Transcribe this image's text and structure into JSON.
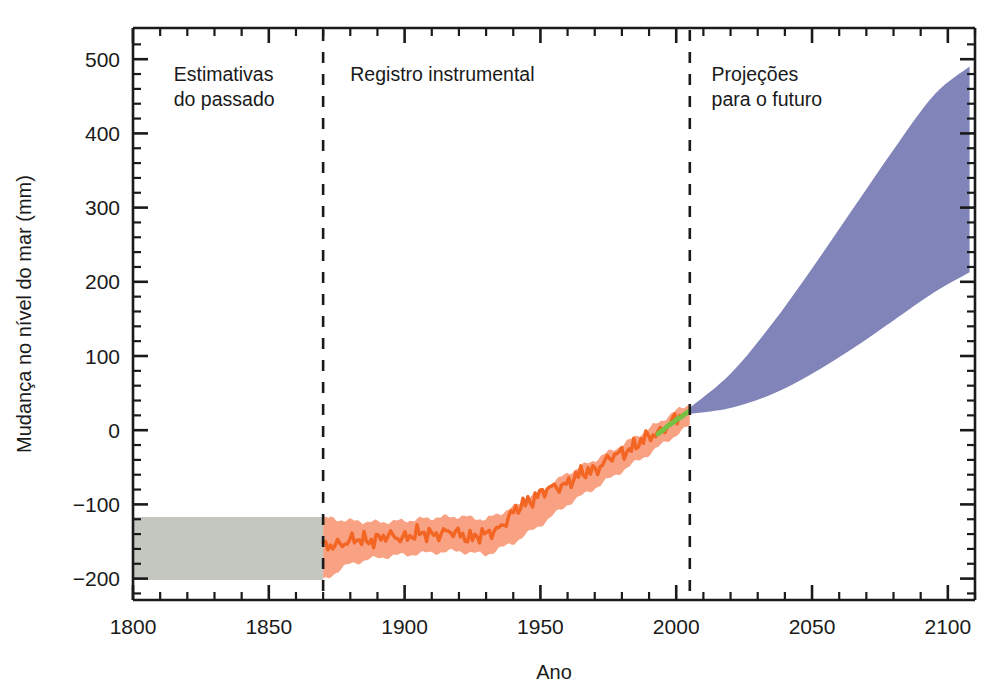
{
  "chart_data": {
    "type": "area",
    "title": "",
    "subtitle": "",
    "xlabel": "Ano",
    "ylabel": "Mudança no nível do mar (mm)",
    "xlim": [
      1800,
      2110
    ],
    "ylim": [
      -230,
      530
    ],
    "xticks": [
      1800,
      1850,
      1900,
      1950,
      2000,
      2050,
      2100
    ],
    "xtick_labels": [
      "1800",
      "1850",
      "1900",
      "1950",
      "2000",
      "2050",
      "2100"
    ],
    "yticks": [
      -200,
      -100,
      0,
      100,
      200,
      300,
      400,
      500
    ],
    "ytick_labels": [
      "−200",
      "−100",
      "0",
      "100",
      "200",
      "300",
      "400",
      "500"
    ],
    "x_minor_tick_step": 10,
    "y_minor_tick_step": 20,
    "grid": false,
    "legend": "none",
    "annotations": [
      {
        "name": "past-estimates-label",
        "lines": [
          "Estimativas",
          "do passado"
        ],
        "x": 1815,
        "y": 470
      },
      {
        "name": "instrumental-record-label",
        "lines": [
          "Registro instrumental"
        ],
        "x": 1880,
        "y": 470
      },
      {
        "name": "future-projections-label",
        "lines": [
          "Projeções",
          "para o futuro"
        ],
        "x": 2013,
        "y": 470
      }
    ],
    "dividers": [
      {
        "name": "divider-1870",
        "x": 1870,
        "style": "dashed"
      },
      {
        "name": "divider-2005",
        "x": 2005,
        "style": "dashed"
      }
    ],
    "series": [
      {
        "name": "Estimativas do passado (paleo proxy range)",
        "key": "paleo_band",
        "type": "band",
        "color": "#c4c6c0",
        "x": [
          1800,
          1870
        ],
        "y_lower": [
          -202,
          -202
        ],
        "y_upper": [
          -117,
          -117
        ]
      },
      {
        "name": "Registro de marégrafos – incerteza",
        "key": "tide_gauge_band",
        "type": "band",
        "color": "#f9a183",
        "x": [
          1870,
          1880,
          1890,
          1900,
          1910,
          1920,
          1930,
          1940,
          1950,
          1960,
          1970,
          1980,
          1990,
          2000,
          2005
        ],
        "y_lower": [
          -202,
          -180,
          -172,
          -168,
          -165,
          -163,
          -168,
          -152,
          -128,
          -100,
          -78,
          -55,
          -32,
          -6,
          6
        ],
        "y_upper": [
          -118,
          -122,
          -124,
          -122,
          -118,
          -116,
          -120,
          -104,
          -82,
          -58,
          -40,
          -20,
          2,
          26,
          36
        ]
      },
      {
        "name": "Registro de marégrafos – média",
        "key": "tide_gauge_line",
        "type": "line",
        "color": "#f26522",
        "x": [
          1870,
          1875,
          1880,
          1885,
          1890,
          1895,
          1900,
          1905,
          1910,
          1915,
          1920,
          1925,
          1930,
          1935,
          1940,
          1945,
          1950,
          1955,
          1960,
          1965,
          1970,
          1975,
          1980,
          1985,
          1990,
          1995,
          2000,
          2003
        ],
        "y": [
          -160,
          -152,
          -150,
          -148,
          -146,
          -144,
          -143,
          -141,
          -139,
          -138,
          -140,
          -144,
          -142,
          -130,
          -112,
          -96,
          -85,
          -78,
          -70,
          -60,
          -52,
          -40,
          -30,
          -20,
          -10,
          2,
          14,
          22
        ]
      },
      {
        "name": "Altimetria por satélite",
        "key": "satellite_line",
        "type": "line",
        "color": "#76c043",
        "x": [
          1993,
          1995,
          1997,
          1999,
          2001,
          2003,
          2005
        ],
        "y": [
          -6,
          0,
          6,
          11,
          16,
          21,
          26
        ]
      },
      {
        "name": "Projeções para o futuro",
        "key": "projection_band",
        "type": "band",
        "color": "#8184b8",
        "x": [
          2005,
          2020,
          2035,
          2050,
          2065,
          2080,
          2095,
          2108
        ],
        "y_lower": [
          22,
          30,
          48,
          76,
          110,
          148,
          186,
          213
        ],
        "y_upper": [
          30,
          76,
          142,
          218,
          298,
          378,
          452,
          490
        ]
      }
    ]
  },
  "axes": {
    "x_axis_title": "Ano",
    "y_axis_title": "Mudança no nível do mar (mm)"
  },
  "colors": {
    "paleo_band": "#c4c6c0",
    "tide_gauge_band": "#f9a183",
    "tide_gauge_line": "#f26522",
    "satellite_line": "#76c043",
    "projection_band": "#8184b8",
    "axis": "#1a1a1a",
    "background": "#ffffff"
  }
}
